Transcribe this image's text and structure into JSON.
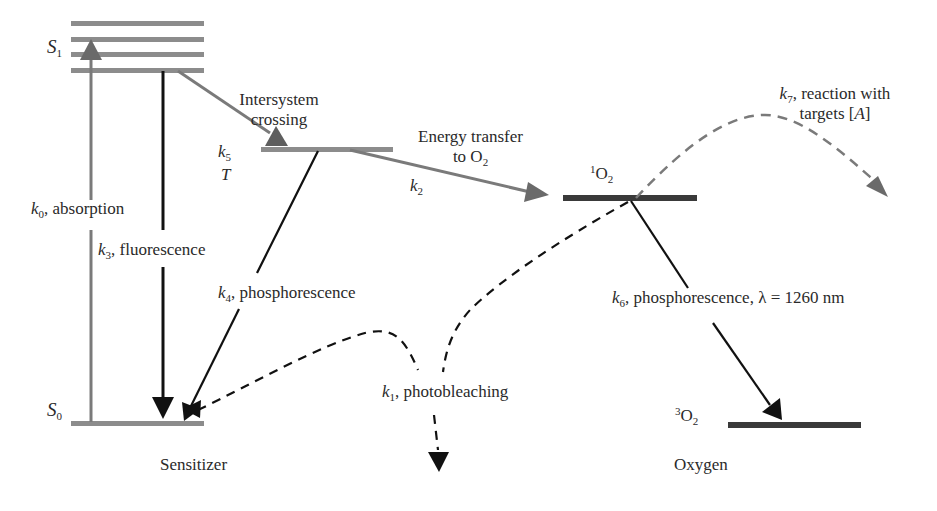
{
  "diagram": {
    "colors": {
      "sensitizer_levels": "#8c8c8c",
      "oxygen_levels": "#3a3a3a",
      "gray_arrows": "#7a7a7a",
      "black_arrows": "#111111",
      "text": "#2a2a2a"
    },
    "states": {
      "s1": {
        "symbol": "S",
        "subscript": "1"
      },
      "s0": {
        "symbol": "S",
        "subscript": "0"
      },
      "t": {
        "symbol": "T"
      },
      "singlet_oxygen": {
        "superscript": "1",
        "symbol": "O",
        "subscript": "2"
      },
      "triplet_oxygen": {
        "superscript": "3",
        "symbol": "O",
        "subscript": "2"
      }
    },
    "processes": {
      "k0": {
        "k": "k",
        "sub": "0",
        "text": ", absorption"
      },
      "k3": {
        "k": "k",
        "sub": "3",
        "text": ", fluorescence"
      },
      "k4": {
        "k": "k",
        "sub": "4",
        "text": ", phosphorescence"
      },
      "k5": {
        "k": "k",
        "sub": "5"
      },
      "isc": {
        "line1": "Intersystem",
        "line2": "crossing"
      },
      "k2": {
        "k": "k",
        "sub": "2"
      },
      "energy_transfer": {
        "line1": "Energy transfer",
        "line2_prefix": "to O",
        "line2_sub": "2"
      },
      "k7": {
        "k": "k",
        "sub": "7",
        "text": ", reaction with",
        "line2_prefix": "targets [",
        "line2_var": "A",
        "line2_suffix": "]"
      },
      "k6": {
        "k": "k",
        "sub": "6",
        "text": ", phosphorescence, λ = 1260 nm"
      },
      "k1": {
        "k": "k",
        "sub": "1",
        "text": ", photobleaching"
      }
    },
    "groups": {
      "sensitizer": "Sensitizer",
      "oxygen": "Oxygen"
    }
  }
}
